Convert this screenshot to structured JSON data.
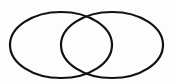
{
  "diagram": {
    "type": "venn",
    "sets": [
      {
        "id": "left",
        "cx": 61,
        "cy": 45,
        "rx": 51,
        "ry": 33
      },
      {
        "id": "right",
        "cx": 112,
        "cy": 45,
        "rx": 51,
        "ry": 33
      }
    ],
    "stroke_color": "#111111",
    "stroke_width": 2.2,
    "background": "#fdfdfd"
  }
}
